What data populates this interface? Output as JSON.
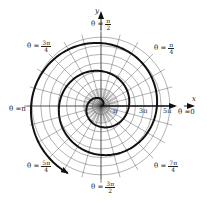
{
  "figure": {
    "type": "polar-spiral",
    "axes": {
      "x_label": "x",
      "y_label": "y"
    },
    "colors": {
      "grid": "#555555",
      "spiral": "#111111",
      "axis": "#111111",
      "text": "#222222"
    },
    "angle_labels": [
      {
        "id": "theta-0",
        "prefix": "θ = ",
        "num": "0",
        "den": ""
      },
      {
        "id": "theta-pi-4",
        "prefix": "θ = ",
        "num": "π",
        "den": "4"
      },
      {
        "id": "theta-pi-2",
        "prefix": "θ = ",
        "num": "π",
        "den": "2"
      },
      {
        "id": "theta-3pi-4",
        "prefix": "θ = ",
        "num": "3π",
        "den": "4"
      },
      {
        "id": "theta-pi",
        "prefix": "θ = ",
        "num": "π",
        "den": ""
      },
      {
        "id": "theta-5pi-4",
        "prefix": "θ = ",
        "num": "5π",
        "den": "4"
      },
      {
        "id": "theta-3pi-2",
        "prefix": "θ = ",
        "num": "3π",
        "den": "2"
      },
      {
        "id": "theta-7pi-4",
        "prefix": "θ = ",
        "num": "7π",
        "den": "4"
      }
    ],
    "radial_ticks": [
      "π",
      "3π",
      "5π"
    ],
    "grid": {
      "rings": 8,
      "spokes": 24
    },
    "spiral": {
      "theta_start": 0,
      "theta_end_pi": 5.35,
      "scale_px_per_rad": 4.45
    }
  }
}
